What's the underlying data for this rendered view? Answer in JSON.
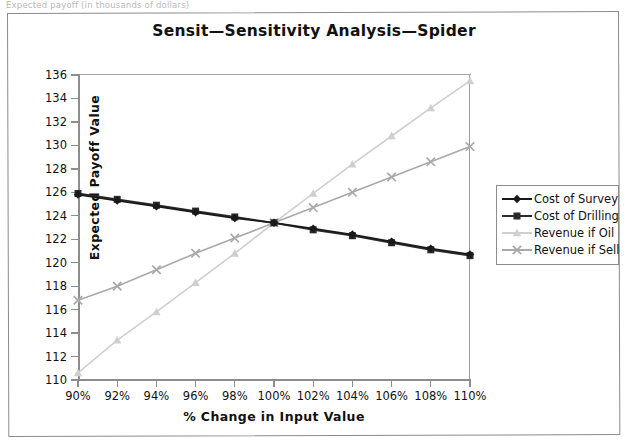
{
  "scan": {
    "top_caption": "Expected payoff (in thousands of dollars)"
  },
  "chart_data": {
    "type": "line",
    "title": "Sensit—Sensitivity  Analysis—Spider",
    "xlabel": "% Change in Input Value",
    "ylabel": "Expected Payoff Value",
    "categories": [
      "90%",
      "92%",
      "94%",
      "96%",
      "98%",
      "100%",
      "102%",
      "104%",
      "106%",
      "108%",
      "110%"
    ],
    "x": [
      90,
      92,
      94,
      96,
      98,
      100,
      102,
      104,
      106,
      108,
      110
    ],
    "xlim": [
      90,
      110
    ],
    "ylim": [
      110,
      136
    ],
    "yticks": [
      110,
      112,
      114,
      116,
      118,
      120,
      122,
      124,
      126,
      128,
      130,
      132,
      134,
      136
    ],
    "grid": false,
    "legend_position": "right",
    "series": [
      {
        "name": "Cost of Survey",
        "color": "#1a1a1a",
        "marker": "diamond",
        "values": [
          125.8,
          125.3,
          124.8,
          124.3,
          123.8,
          123.4,
          122.9,
          122.4,
          121.8,
          121.2,
          120.7
        ]
      },
      {
        "name": "Cost of Drilling",
        "color": "#2b2b2b",
        "marker": "square",
        "values": [
          125.9,
          125.4,
          124.9,
          124.4,
          123.9,
          123.4,
          122.8,
          122.3,
          121.7,
          121.1,
          120.6
        ]
      },
      {
        "name": "Revenue if Oil",
        "color": "#cfcfcf",
        "marker": "triangle",
        "values": [
          110.6,
          113.4,
          115.8,
          118.3,
          120.8,
          123.4,
          125.9,
          128.4,
          130.8,
          133.2,
          135.5
        ]
      },
      {
        "name": "Revenue if Sell",
        "color": "#a9a9a9",
        "marker": "cross",
        "values": [
          116.8,
          118.0,
          119.4,
          120.8,
          122.1,
          123.4,
          124.7,
          126.0,
          127.3,
          128.6,
          129.9
        ]
      }
    ]
  }
}
